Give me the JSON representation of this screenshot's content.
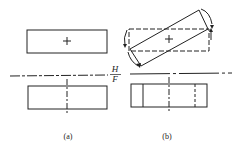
{
  "labels": {
    "view_a": "(a)",
    "view_b": "(b)",
    "plane_top": "H",
    "plane_bottom": "F"
  },
  "colors": {
    "line": "#222222",
    "background": "#ffffff"
  }
}
